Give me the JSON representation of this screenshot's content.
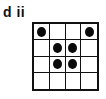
{
  "panel_label": "d ii",
  "grid": {
    "rows": 4,
    "cols": 4,
    "filled": [
      [
        0,
        0
      ],
      [
        0,
        3
      ],
      [
        1,
        1
      ],
      [
        1,
        2
      ],
      [
        2,
        1
      ],
      [
        2,
        2
      ]
    ]
  }
}
